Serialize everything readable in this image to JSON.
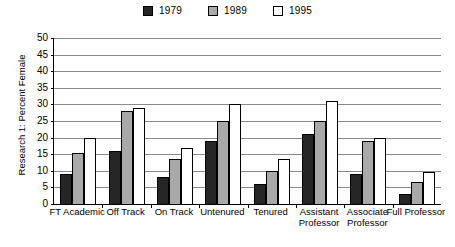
{
  "chart_data": {
    "type": "bar",
    "title": "",
    "xlabel": "",
    "ylabel": "Research 1: Percent Female",
    "ylim": [
      0,
      50
    ],
    "ytick_step": 5,
    "yticks": [
      0,
      5,
      10,
      15,
      20,
      25,
      30,
      35,
      40,
      45,
      50
    ],
    "grid": true,
    "legend_position": "top-center",
    "categories": [
      "FT Academic",
      "Off Track",
      "On Track",
      "Untenured",
      "Tenured",
      "Assistant Professor",
      "Associate Professor",
      "Full Professor"
    ],
    "series": [
      {
        "name": "1979",
        "color": "#262626",
        "values": [
          9,
          16,
          8,
          19,
          6,
          21,
          9,
          3
        ]
      },
      {
        "name": "1989",
        "color": "#a9a9a9",
        "values": [
          15.5,
          28,
          13.5,
          25,
          10,
          25,
          19,
          6.5
        ]
      },
      {
        "name": "1995",
        "color": "#ffffff",
        "values": [
          20,
          29,
          17,
          30,
          13.5,
          31,
          20,
          9.5
        ]
      }
    ]
  }
}
